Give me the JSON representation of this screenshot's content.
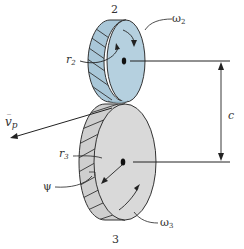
{
  "diagram": {
    "type": "helical gear pair",
    "gears": [
      {
        "id": "gear-2",
        "label": "2",
        "radius_label": "r",
        "radius_sub": "2",
        "omega_label": "ω",
        "omega_sub": "2",
        "color": "#a9c7d8"
      },
      {
        "id": "gear-3",
        "label": "3",
        "radius_label": "r",
        "radius_sub": "3",
        "omega_label": "ω",
        "omega_sub": "3",
        "color": "#d4d4d4"
      }
    ],
    "labels": {
      "center_distance": "c",
      "pitch_velocity": "v",
      "pitch_velocity_sub": "p",
      "helix_angle": "ψ"
    },
    "colors": {
      "line": "#222222",
      "hatch": "#333333",
      "gear2_fill": "#a9c7d8",
      "gear2_face": "#b5d0df",
      "gear3_fill": "#cfcfcf",
      "gear3_face": "#d9d9d9"
    }
  }
}
